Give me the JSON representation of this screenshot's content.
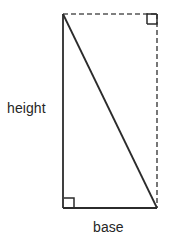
{
  "figure": {
    "type": "right-triangle-geometry-diagram",
    "background_color": "#ffffff",
    "stroke_color": "#2b2b2b",
    "dashed_stroke_color": "#555555",
    "text_color": "#262626"
  },
  "labels": {
    "height": "height",
    "base": "base"
  },
  "geometry": {
    "apex_top_left": {
      "x": 63,
      "y": 14
    },
    "corner_bottom_left": {
      "x": 63,
      "y": 208
    },
    "corner_bottom_right": {
      "x": 157,
      "y": 208
    },
    "corner_top_right": {
      "x": 157,
      "y": 14
    },
    "solid_edges": [
      {
        "name": "height-side",
        "from": "apex_top_left",
        "to": "corner_bottom_left",
        "style": "solid"
      },
      {
        "name": "base-side",
        "from": "corner_bottom_left",
        "to": "corner_bottom_right",
        "style": "solid"
      },
      {
        "name": "hypotenuse",
        "from": "apex_top_left",
        "to": "corner_bottom_right",
        "style": "solid"
      }
    ],
    "dashed_edges": [
      {
        "name": "top-dashed-edge",
        "from": "apex_top_left",
        "to": "corner_top_right",
        "style": "dashed"
      },
      {
        "name": "right-dashed-edge",
        "from": "corner_top_right",
        "to": "corner_bottom_right",
        "style": "dashed"
      }
    ],
    "right_angle_markers": [
      {
        "name": "bottom-left-right-angle",
        "x": 64,
        "y": 198,
        "size": 10
      },
      {
        "name": "top-right-right-angle",
        "x": 147,
        "y": 14,
        "size": 10
      }
    ]
  }
}
